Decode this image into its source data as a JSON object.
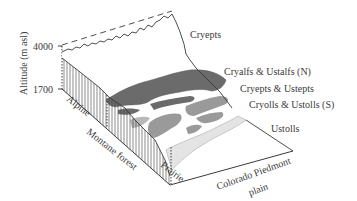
{
  "figure": {
    "type": "block-diagram",
    "y_axis": {
      "label": "Altitude (m asl)",
      "ticks": [
        "4000",
        "1700"
      ]
    },
    "zones": [
      {
        "label": "Alpine"
      },
      {
        "label": "Montane forest"
      },
      {
        "label": "Prairie"
      },
      {
        "label": "Colorado Piedmont",
        "label2": "plain"
      }
    ],
    "soil_labels": [
      {
        "label": "Cryepts"
      },
      {
        "label": "Cryalfs & Ustalfs (N)"
      },
      {
        "label": "Cryepts & Ustepts"
      },
      {
        "label": "Cryolls & Ustolls (S)"
      },
      {
        "label": "Ustolls"
      }
    ],
    "colors": {
      "line": "#3a3a3a",
      "dark_gray": "#6b6b6b",
      "mid_gray": "#9a9a9a",
      "light_gray": "#c6c6c6",
      "very_light": "#e2e2e2",
      "background": "#ffffff"
    }
  }
}
